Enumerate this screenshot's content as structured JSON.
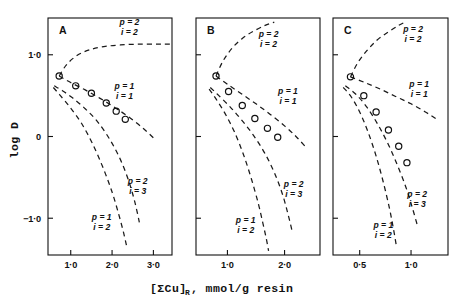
{
  "figure": {
    "xlabel_main": "[ΣCu]",
    "xlabel_sub": "R",
    "xlabel_rest": " ,  mmol/g resin",
    "ylabel": "log D"
  },
  "chart_data": {
    "type": "scatter",
    "title": "",
    "xlabel": "[ΣCu]R , mmol/g resin",
    "ylabel": "log D",
    "grid": false,
    "legend": "inline-curve-labels",
    "ylim": [
      -1.45,
      1.45
    ],
    "yticks": [
      1.0,
      0.0,
      -1.0
    ],
    "ytick_labels": [
      "1·0",
      "0",
      "−1·0"
    ],
    "panels": [
      {
        "letter": "A",
        "xlim": [
          0.45,
          3.45
        ],
        "xticks": [
          1.0,
          2.0,
          3.0
        ],
        "xtick_labels": [
          "1·0",
          "2·0",
          "3·0"
        ],
        "points": {
          "x": [
            0.72,
            1.12,
            1.5,
            1.86,
            2.1,
            2.32
          ],
          "y": [
            0.74,
            0.62,
            0.53,
            0.41,
            0.31,
            0.21
          ]
        },
        "curves": [
          {
            "name": "p=2, i=2",
            "label_p": "p = 2",
            "label_i": "i = 2",
            "label_x": 2.42,
            "label_y": 1.36,
            "x": [
              0.72,
              0.9,
              1.15,
              1.45,
              1.8,
              2.2,
              2.65,
              3.1,
              3.4
            ],
            "y": [
              0.74,
              0.88,
              0.99,
              1.06,
              1.1,
              1.12,
              1.13,
              1.13,
              1.13
            ]
          },
          {
            "name": "p=1, i=1",
            "label_p": "p = 1",
            "label_i": "i = 1",
            "label_x": 2.3,
            "label_y": 0.58,
            "x": [
              0.72,
              1.0,
              1.35,
              1.7,
              2.05,
              2.4,
              2.75,
              3.05
            ],
            "y": [
              0.74,
              0.66,
              0.57,
              0.47,
              0.36,
              0.24,
              0.1,
              -0.04
            ]
          },
          {
            "name": "p=2, i=3",
            "label_p": "p = 2",
            "label_i": "i = 3",
            "label_x": 2.62,
            "label_y": -0.58,
            "x": [
              0.6,
              0.8,
              1.05,
              1.35,
              1.65,
              1.95,
              2.2,
              2.4,
              2.55,
              2.66
            ],
            "y": [
              0.62,
              0.56,
              0.47,
              0.34,
              0.18,
              -0.04,
              -0.28,
              -0.54,
              -0.8,
              -1.05
            ]
          },
          {
            "name": "p=1, i=2",
            "label_p": "p = 1",
            "label_i": "i = 2",
            "label_x": 1.75,
            "label_y": -1.02,
            "x": [
              0.58,
              0.75,
              0.98,
              1.25,
              1.52,
              1.78,
              2.0,
              2.16,
              2.28,
              2.36
            ],
            "y": [
              0.6,
              0.5,
              0.36,
              0.17,
              -0.08,
              -0.38,
              -0.68,
              -0.95,
              -1.18,
              -1.36
            ]
          }
        ]
      },
      {
        "letter": "B",
        "xlim": [
          0.45,
          2.62
        ],
        "xticks": [
          1.0,
          2.0
        ],
        "xtick_labels": [
          "1·0",
          "2·0"
        ],
        "points": {
          "x": [
            0.8,
            1.02,
            1.26,
            1.48,
            1.7,
            1.88
          ],
          "y": [
            0.74,
            0.55,
            0.38,
            0.22,
            0.1,
            -0.01
          ]
        },
        "curves": [
          {
            "name": "p=2, i=2",
            "label_p": "p = 2",
            "label_i": "i = 2",
            "label_x": 1.72,
            "label_y": 1.22,
            "x": [
              0.8,
              0.92,
              1.08,
              1.26,
              1.46,
              1.66,
              1.82
            ],
            "y": [
              0.74,
              0.92,
              1.08,
              1.2,
              1.29,
              1.36,
              1.4
            ]
          },
          {
            "name": "p=1, i=1",
            "label_p": "p = 1",
            "label_i": "i = 1",
            "label_x": 2.06,
            "label_y": 0.52,
            "x": [
              0.8,
              1.0,
              1.25,
              1.5,
              1.75,
              2.0,
              2.2,
              2.36
            ],
            "y": [
              0.74,
              0.64,
              0.52,
              0.4,
              0.27,
              0.13,
              0.0,
              -0.12
            ]
          },
          {
            "name": "p=2, i=3",
            "label_p": "p = 2",
            "label_i": "i = 3",
            "label_x": 2.16,
            "label_y": -0.62,
            "x": [
              0.7,
              0.85,
              1.05,
              1.25,
              1.45,
              1.65,
              1.82,
              1.96,
              2.06,
              2.14
            ],
            "y": [
              0.6,
              0.5,
              0.36,
              0.2,
              0.02,
              -0.2,
              -0.44,
              -0.7,
              -0.95,
              -1.18
            ]
          },
          {
            "name": "p=1, i=2",
            "label_p": "p = 1",
            "label_i": "i = 2",
            "label_x": 1.32,
            "label_y": -1.06,
            "x": [
              0.68,
              0.8,
              0.96,
              1.12,
              1.28,
              1.42,
              1.54,
              1.62,
              1.68,
              1.72
            ],
            "y": [
              0.58,
              0.46,
              0.28,
              0.06,
              -0.22,
              -0.52,
              -0.82,
              -1.06,
              -1.25,
              -1.4
            ]
          }
        ]
      },
      {
        "letter": "C",
        "xlim": [
          0.24,
          1.36
        ],
        "xticks": [
          0.5,
          1.0
        ],
        "xtick_labels": [
          "0·5",
          "1·0"
        ],
        "points": {
          "x": [
            0.41,
            0.54,
            0.66,
            0.78,
            0.88,
            0.96
          ],
          "y": [
            0.73,
            0.5,
            0.3,
            0.08,
            -0.12,
            -0.32
          ]
        },
        "curves": [
          {
            "name": "p=2, i=2",
            "label_p": "p = 2",
            "label_i": "i = 2",
            "label_x": 1.02,
            "label_y": 1.28,
            "x": [
              0.41,
              0.48,
              0.57,
              0.67,
              0.78,
              0.88,
              0.96
            ],
            "y": [
              0.73,
              0.9,
              1.05,
              1.18,
              1.28,
              1.36,
              1.41
            ]
          },
          {
            "name": "p=1, i=1",
            "label_p": "p = 1",
            "label_i": "i = 1",
            "label_x": 1.08,
            "label_y": 0.6,
            "x": [
              0.41,
              0.55,
              0.7,
              0.85,
              1.0,
              1.14,
              1.24
            ],
            "y": [
              0.73,
              0.66,
              0.58,
              0.49,
              0.4,
              0.3,
              0.22
            ]
          },
          {
            "name": "p=2, i=3",
            "label_p": "p = 2",
            "label_i": "i = 3",
            "label_x": 1.06,
            "label_y": -0.74,
            "x": [
              0.36,
              0.46,
              0.57,
              0.68,
              0.78,
              0.87,
              0.95,
              1.01,
              1.06
            ],
            "y": [
              0.62,
              0.52,
              0.36,
              0.14,
              -0.1,
              -0.36,
              -0.62,
              -0.86,
              -1.08
            ]
          },
          {
            "name": "p=1, i=2",
            "label_p": "p = 1",
            "label_i": "i = 2",
            "label_x": 0.73,
            "label_y": -1.12,
            "x": [
              0.34,
              0.42,
              0.5,
              0.58,
              0.66,
              0.73,
              0.79,
              0.83,
              0.86
            ],
            "y": [
              0.6,
              0.48,
              0.3,
              0.06,
              -0.24,
              -0.56,
              -0.88,
              -1.14,
              -1.36
            ]
          }
        ]
      }
    ]
  }
}
